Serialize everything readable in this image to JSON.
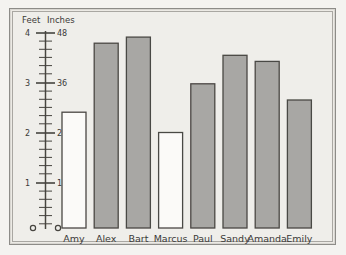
{
  "chart_data": {
    "type": "bar",
    "title": "",
    "xlabel": "",
    "ylabel": "Inches",
    "ylabel_secondary": "Feet",
    "categories": [
      "Amy",
      "Alex",
      "Bart",
      "Marcus",
      "Paul",
      "Sandy",
      "Amanda",
      "Emily"
    ],
    "values": [
      28.5,
      45.5,
      47,
      23.5,
      35.5,
      42.5,
      41,
      31.5
    ],
    "unit": "inches",
    "ylim": [
      0,
      48
    ],
    "grid": false,
    "legend": false,
    "bar_fills": [
      "white",
      "gray",
      "gray",
      "white",
      "gray",
      "gray",
      "gray",
      "gray"
    ],
    "feet_ticks": [
      {
        "feet": "4",
        "inches": "48"
      },
      {
        "feet": "3",
        "inches": "36"
      },
      {
        "feet": "2",
        "inches": "24"
      },
      {
        "feet": "1",
        "inches": "12"
      },
      {
        "feet": "0",
        "inches": "0"
      }
    ],
    "minor_tick_interval_inches": 2
  },
  "axis": {
    "feet_header": "Feet",
    "inches_header": "Inches"
  },
  "ticks": {
    "t48_feet": "4",
    "t48_inches": "48",
    "t36_feet": "3",
    "t36_inches": "36",
    "t24_feet": "2",
    "t24_inches": "24",
    "t12_feet": "1",
    "t12_inches": "12",
    "t0_feet": "0",
    "t0_inches": "0"
  },
  "bars": [
    {
      "label": "Amy",
      "value": 28.5,
      "fill": "white"
    },
    {
      "label": "Alex",
      "value": 45.5,
      "fill": "gray"
    },
    {
      "label": "Bart",
      "value": 47,
      "fill": "gray"
    },
    {
      "label": "Marcus",
      "value": 23.5,
      "fill": "white"
    },
    {
      "label": "Paul",
      "value": 35.5,
      "fill": "gray"
    },
    {
      "label": "Sandy",
      "value": 42.5,
      "fill": "gray"
    },
    {
      "label": "Amanda",
      "value": 41,
      "fill": "gray"
    },
    {
      "label": "Emily",
      "value": 31.5,
      "fill": "gray"
    }
  ],
  "colors": {
    "paper": "#efeeea",
    "frame": "#8d8c88",
    "ink": "#3b3a38",
    "bar_gray": "#a8a7a4",
    "bar_white": "#fbfaf8"
  }
}
